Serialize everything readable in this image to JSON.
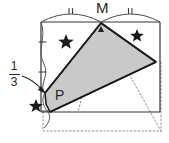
{
  "figure": {
    "type": "geometry-diagram",
    "canvas": {
      "width": 169,
      "height": 143
    },
    "colors": {
      "stroke": "#262626",
      "shaded_fill": "#c9c9c9",
      "shaded_stroke": "#1a1a1a",
      "dotted": "#8a8a8a",
      "background": "#ffffff"
    },
    "labels": {
      "vertex_M": "M",
      "vertex_P": "P",
      "fraction_numerator": "1",
      "fraction_denominator": "3"
    },
    "congruence_marks": {
      "top_arcs": "double-tick",
      "left_side_ticks": "single-tick",
      "count_top_arcs": 2,
      "count_left_ticks": 3
    },
    "stars": [
      {
        "name": "star-upper-left",
        "x": 66,
        "y": 41
      },
      {
        "name": "star-upper-right",
        "x": 137,
        "y": 35
      },
      {
        "name": "star-lower-left",
        "x": 36,
        "y": 105
      }
    ],
    "points": {
      "rect_top_left": {
        "x": 41,
        "y": 22
      },
      "rect_top_right": {
        "x": 160,
        "y": 22
      },
      "rect_bottom_left": {
        "x": 41,
        "y": 112
      },
      "rect_bottom_right": {
        "x": 160,
        "y": 112
      },
      "M": {
        "x": 101,
        "y": 22
      },
      "P": {
        "x": 48,
        "y": 92
      },
      "triangle_right": {
        "x": 156,
        "y": 62
      },
      "fold_bottom": {
        "x": 50,
        "y": 112
      },
      "dotted_apex": {
        "x": 160,
        "y": 131
      }
    }
  }
}
